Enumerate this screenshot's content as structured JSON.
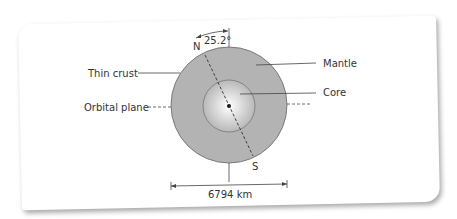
{
  "diagram": {
    "labels": {
      "north": "N",
      "south": "S",
      "tilt": "25.2°",
      "thin_crust": "Thin crust",
      "orbital_plane": "Orbital plane",
      "mantle": "Mantle",
      "core": "Core",
      "diameter": "6794 km"
    },
    "colors": {
      "mantle": "#b3b3b3",
      "core_center": "#ffffff",
      "core_edge": "#b8b8b8",
      "lines": "#444444"
    }
  }
}
